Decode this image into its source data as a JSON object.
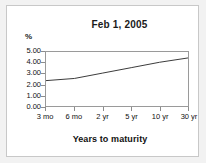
{
  "chart_data": {
    "type": "line",
    "title": "Feb 1, 2005",
    "xlabel": "Years to maturity",
    "ylabel": "%",
    "categories": [
      "3 mo",
      "6 mo",
      "2 yr",
      "5 yr",
      "10 yr",
      "30 yr"
    ],
    "values": [
      2.35,
      2.55,
      3.05,
      3.55,
      4.05,
      4.45
    ],
    "series": [
      {
        "name": "Treasury yield curve",
        "values": [
          2.35,
          2.55,
          3.05,
          3.55,
          4.05,
          4.45
        ]
      }
    ],
    "ylim": [
      0.0,
      5.0
    ],
    "ytick_labels": [
      "5.00",
      "4.00",
      "3.00",
      "2.00",
      "1.00",
      "0.00"
    ],
    "ytick_values": [
      5.0,
      4.0,
      3.0,
      2.0,
      1.0,
      0.0
    ],
    "grid": false,
    "legend": "none",
    "line_color": "#3c3c3c"
  },
  "figure": {
    "background_color": "#f2f2f2",
    "panel_color": "#ffffff",
    "border_color": "#c8c8c8",
    "axis_color": "#9a9a9a"
  }
}
